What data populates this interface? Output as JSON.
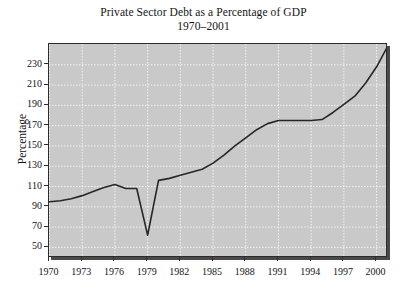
{
  "chart_data": {
    "type": "line",
    "title": "Private Sector Debt as a Percentage of GDP",
    "subtitle": "1970–2001",
    "xlabel": "",
    "ylabel": "Percentage",
    "xlim": [
      1970,
      2001
    ],
    "ylim": [
      40,
      250
    ],
    "grid": true,
    "legend": null,
    "xticks": [
      1970,
      1973,
      1976,
      1979,
      1982,
      1985,
      1988,
      1991,
      1994,
      1997,
      2000
    ],
    "xtick_labels": [
      "1970",
      "1973",
      "1976",
      "1979",
      "1982",
      "1985",
      "1988",
      "1991",
      "1994",
      "1997",
      "2000"
    ],
    "yticks": [
      50,
      70,
      90,
      110,
      130,
      150,
      170,
      190,
      210,
      230
    ],
    "ytick_labels": [
      "50",
      "70",
      "90",
      "110",
      "130",
      "150",
      "170",
      "190",
      "210",
      "230"
    ],
    "line_color": "#262626",
    "plot_background": "#c9c9c9",
    "gridline_color": "#f2f2f2",
    "series": [
      {
        "name": "Private Sector Debt (% of GDP)",
        "x": [
          1970,
          1971,
          1972,
          1973,
          1974,
          1975,
          1976,
          1977,
          1978,
          1979,
          1980,
          1981,
          1982,
          1983,
          1984,
          1985,
          1986,
          1987,
          1988,
          1989,
          1990,
          1991,
          1992,
          1993,
          1994,
          1995,
          1996,
          1997,
          1998,
          1999,
          2000,
          2001
        ],
        "y": [
          95,
          96,
          98,
          101,
          105,
          109,
          112,
          108,
          108,
          62,
          116,
          118,
          121,
          124,
          127,
          133,
          141,
          150,
          158,
          166,
          172,
          175,
          175,
          175,
          175,
          176,
          183,
          191,
          199,
          212,
          228,
          248
        ]
      }
    ]
  }
}
